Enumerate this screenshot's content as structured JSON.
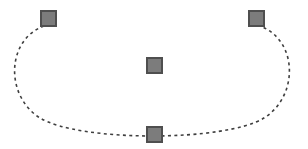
{
  "figure": {
    "title": "",
    "background_color": "#ffffff",
    "width": 308,
    "height": 149
  },
  "style": {
    "node_fill": "#7c7c7c",
    "node_stroke": "#4f4f4f",
    "node_stroke_width": 2,
    "node_width": 17,
    "node_height": 17,
    "curve_color": "#3f3f3f",
    "curve_width": 1.6,
    "curve_dash": "3 3.4"
  },
  "chart_data": {
    "type": "scatter",
    "title": "",
    "xlabel": "",
    "ylabel": "",
    "xlim": [
      0,
      308
    ],
    "ylim": [
      0,
      149
    ],
    "grid": false,
    "legend": null,
    "annotations": [],
    "series": [
      {
        "name": "square-markers",
        "marker": "square",
        "marker_color": "#7c7c7c",
        "marker_edge_color": "#4f4f4f",
        "points": [
          {
            "label": "top-left",
            "x": 48,
            "y": 18
          },
          {
            "label": "top-right",
            "x": 256,
            "y": 18
          },
          {
            "label": "center",
            "x": 154,
            "y": 65
          },
          {
            "label": "bottom-center",
            "x": 155,
            "y": 134
          }
        ]
      },
      {
        "name": "dashed-arc",
        "marker": "none",
        "linestyle": "dashed",
        "line_color": "#3f3f3f",
        "description": "open U-shaped elliptical arc from top-left node down around bottom node up to top-right node",
        "path": "M 44 26 C 6 40, 5 96, 40 118 C 80 142, 225 142, 264 118 C 299 96, 298 40, 260 26",
        "extents": {
          "left_x": 8,
          "right_x": 297,
          "bottom_y": 136,
          "top_y": 26
        }
      }
    ]
  },
  "nodes": [
    {
      "name": "square-top-left",
      "left": 40,
      "top": 10
    },
    {
      "name": "square-top-right",
      "left": 248,
      "top": 10
    },
    {
      "name": "square-center",
      "left": 146,
      "top": 57
    },
    {
      "name": "square-bottom-center",
      "left": 146,
      "top": 126
    }
  ]
}
